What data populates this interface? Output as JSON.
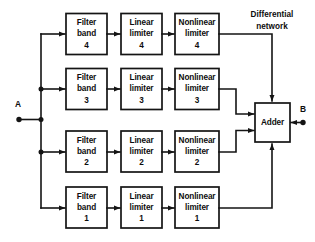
{
  "diagram": {
    "type": "block-diagram",
    "background_color": "#ffffff",
    "line_color": "#141414",
    "terminals": {
      "input": {
        "label": "A"
      },
      "output": {
        "label": "B"
      }
    },
    "annotations": {
      "differential_network": {
        "line1": "Differential",
        "line2": "network"
      }
    },
    "adder": {
      "label": "Adder"
    },
    "channels": [
      {
        "index": 4,
        "filter": {
          "line1": "Filter",
          "line2": "band",
          "line3": "4"
        },
        "linear": {
          "line1": "Linear",
          "line2": "limiter",
          "line3": "4"
        },
        "nonlinear": {
          "line1": "Nonlinear",
          "line2": "limiter",
          "line3": "4"
        }
      },
      {
        "index": 3,
        "filter": {
          "line1": "Filter",
          "line2": "band",
          "line3": "3"
        },
        "linear": {
          "line1": "Linear",
          "line2": "limiter",
          "line3": "3"
        },
        "nonlinear": {
          "line1": "Nonlinear",
          "line2": "limiter",
          "line3": "3"
        }
      },
      {
        "index": 2,
        "filter": {
          "line1": "Filter",
          "line2": "band",
          "line3": "2"
        },
        "linear": {
          "line1": "Linear",
          "line2": "limiter",
          "line3": "2"
        },
        "nonlinear": {
          "line1": "Nonlinear",
          "line2": "limiter",
          "line3": "2"
        }
      },
      {
        "index": 1,
        "filter": {
          "line1": "Filter",
          "line2": "band",
          "line3": "1"
        },
        "linear": {
          "line1": "Linear",
          "line2": "limiter",
          "line3": "1"
        },
        "nonlinear": {
          "line1": "Nonlinear",
          "line2": "limiter",
          "line3": "1"
        }
      }
    ]
  }
}
